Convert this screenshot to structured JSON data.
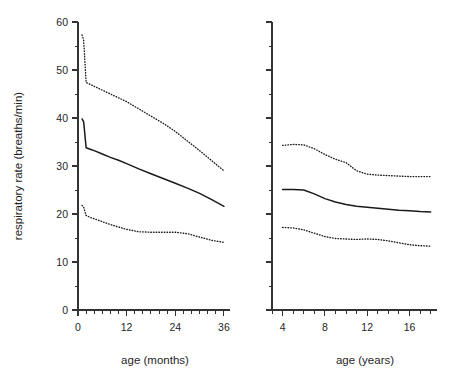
{
  "figure": {
    "background": "#ffffff",
    "line_color": "#1a1a1a",
    "axis_color": "#333333",
    "width": 469,
    "height": 383
  },
  "shared_y": {
    "label": "respiratory rate (breaths/min)",
    "ticks": [
      0,
      10,
      20,
      30,
      40,
      50,
      60
    ],
    "tick_labels": [
      "0",
      "10",
      "20",
      "30",
      "40",
      "50",
      "60"
    ],
    "minor_step": 5,
    "range": [
      0,
      60
    ]
  },
  "chart_data": [
    {
      "type": "line",
      "panel": "left",
      "title": "",
      "xlabel": "age (months)",
      "ylabel": "respiratory rate (breaths/min)",
      "xlim": [
        0,
        37.5
      ],
      "ylim": [
        0,
        60
      ],
      "grid": false,
      "legend": "none",
      "xticks": [
        0,
        12,
        24,
        36
      ],
      "xtick_labels": [
        "0",
        "12",
        "24",
        "36"
      ],
      "x_minor_step": 2,
      "yticks": [
        0,
        10,
        20,
        30,
        40,
        50,
        60
      ],
      "x": [
        1,
        1.4,
        2,
        3,
        4,
        6,
        8,
        10,
        12,
        15,
        18,
        21,
        24,
        27,
        30,
        33,
        36
      ],
      "series": [
        {
          "name": "upper centile (dotted)",
          "style": "dotted",
          "values": [
            57.3,
            56.2,
            47.4,
            47.0,
            46.6,
            45.8,
            45.0,
            44.2,
            43.4,
            41.9,
            40.4,
            38.9,
            37.2,
            35.2,
            33.2,
            31.1,
            29.0
          ]
        },
        {
          "name": "median (solid)",
          "style": "solid",
          "values": [
            39.8,
            39.2,
            33.8,
            33.5,
            33.2,
            32.5,
            31.8,
            31.2,
            30.5,
            29.4,
            28.4,
            27.4,
            26.4,
            25.4,
            24.3,
            23.0,
            21.6
          ]
        },
        {
          "name": "lower centile (dotted)",
          "style": "dotted",
          "values": [
            21.8,
            21.4,
            19.7,
            19.3,
            19.0,
            18.4,
            17.8,
            17.3,
            16.8,
            16.3,
            16.2,
            16.2,
            16.2,
            15.9,
            15.2,
            14.5,
            14.1
          ]
        }
      ]
    },
    {
      "type": "line",
      "panel": "right",
      "title": "",
      "xlabel": "age (years)",
      "ylabel": "respiratory rate (breaths/min)",
      "xlim": [
        3,
        18.6
      ],
      "ylim": [
        0,
        60
      ],
      "grid": false,
      "legend": "none",
      "xticks": [
        4,
        8,
        12,
        16
      ],
      "xtick_labels": [
        "4",
        "8",
        "12",
        "16"
      ],
      "x_minor_step": 1,
      "yticks": [
        0,
        10,
        20,
        30,
        40,
        50,
        60
      ],
      "x": [
        4,
        5,
        6,
        7,
        8,
        9,
        10,
        11,
        12,
        13,
        14,
        15,
        16,
        17,
        18
      ],
      "series": [
        {
          "name": "upper centile (dotted)",
          "style": "dotted",
          "values": [
            34.3,
            34.5,
            34.4,
            33.6,
            32.4,
            31.4,
            30.7,
            29.0,
            28.3,
            28.1,
            28.0,
            27.9,
            27.8,
            27.8,
            27.8
          ]
        },
        {
          "name": "median (solid)",
          "style": "solid",
          "values": [
            25.1,
            25.1,
            25.0,
            24.2,
            23.2,
            22.5,
            22.0,
            21.6,
            21.4,
            21.2,
            21.0,
            20.8,
            20.7,
            20.5,
            20.4
          ]
        },
        {
          "name": "lower centile (dotted)",
          "style": "dotted",
          "values": [
            17.2,
            17.1,
            16.7,
            16.0,
            15.3,
            14.9,
            14.8,
            14.7,
            14.8,
            14.7,
            14.4,
            14.0,
            13.6,
            13.4,
            13.3
          ]
        }
      ]
    }
  ]
}
